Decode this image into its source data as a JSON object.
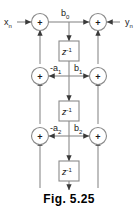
{
  "figure": {
    "caption": "Fig. 5.25",
    "type": "signal-flow-graph",
    "colors": {
      "line": "#8a8a8a",
      "text": "#1a1a1a",
      "background": "#ffffff",
      "node_fill": "#ffffff"
    },
    "inputs": {
      "left_signal": "x",
      "left_signal_sub": "n",
      "right_signal": "y",
      "right_signal_sub": "n"
    },
    "summer_symbol": "+",
    "delay_label": "z",
    "delay_exponent": "-1",
    "stages": [
      {
        "index": 0,
        "feedback_label": "",
        "feedback_sub": "",
        "feedforward_label": "b",
        "feedforward_sub": "0"
      },
      {
        "index": 1,
        "feedback_label": "-a",
        "feedback_sub": "1",
        "feedforward_label": "b",
        "feedforward_sub": "1"
      },
      {
        "index": 2,
        "feedback_label": "-a",
        "feedback_sub": "2",
        "feedforward_label": "b",
        "feedforward_sub": "2"
      }
    ]
  }
}
